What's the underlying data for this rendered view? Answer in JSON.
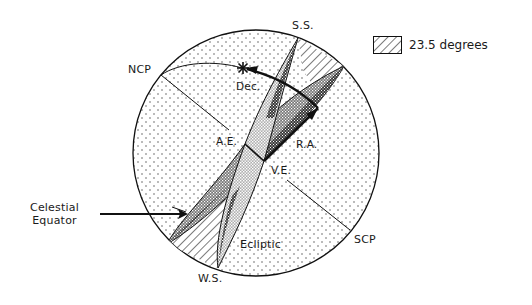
{
  "diagram": {
    "labels": {
      "ncp": "NCP",
      "scp": "SCP",
      "summer_solstice": "S.S.",
      "winter_solstice": "W.S.",
      "declination": "Dec.",
      "right_ascension": "R.A.",
      "autumnal_equinox": "A.E.",
      "vernal_equinox": "V.E.",
      "celestial_equator_line1": "Celestial",
      "celestial_equator_line2": "Equator",
      "ecliptic": "Ecliptic"
    },
    "legend": {
      "swatch_pattern": "diagonal-hatch",
      "text": "23.5 degrees"
    },
    "colors": {
      "outline": "#111111",
      "sphere_fill": "#ffffff",
      "dot_pattern": "#555555",
      "dark_band": "#4a4a4a",
      "mid_band": "#8a8a8a",
      "light_band": "#bdbdbd"
    },
    "icons": {
      "star": "star-icon",
      "arrow": "arrow-icon"
    }
  }
}
